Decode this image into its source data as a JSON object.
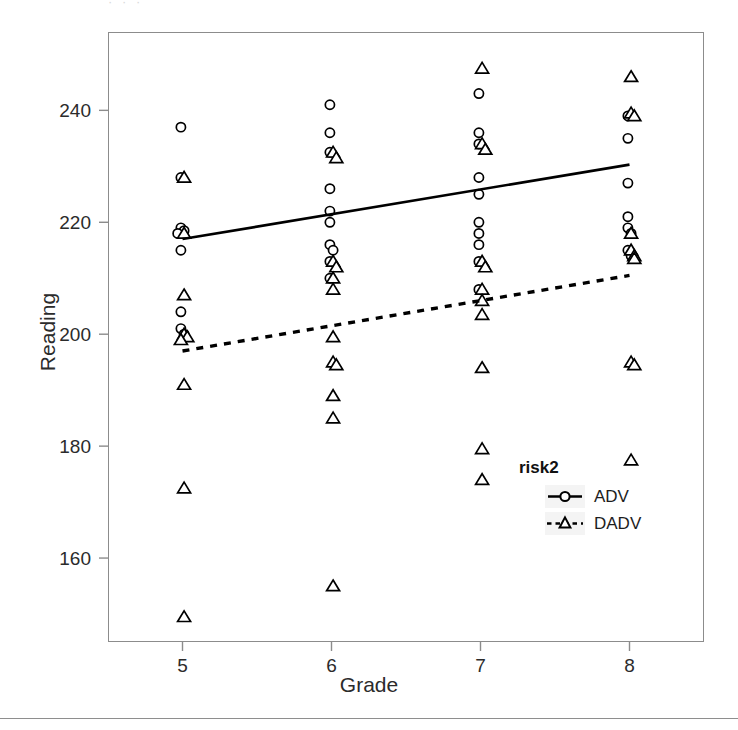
{
  "figure": {
    "scan_artifact_text": "· · ·"
  },
  "axes": {
    "x": {
      "label": "Grade",
      "ticks": [
        "5",
        "6",
        "7",
        "8"
      ],
      "tick_values": [
        5,
        6,
        7,
        8
      ],
      "range": [
        4.5,
        8.5
      ]
    },
    "y": {
      "label": "Reading",
      "ticks": [
        "160",
        "180",
        "200",
        "220",
        "240"
      ],
      "tick_values": [
        160,
        180,
        200,
        220,
        240
      ],
      "range": [
        145,
        254
      ]
    }
  },
  "legend": {
    "title": "risk2",
    "items": [
      {
        "label": "ADV",
        "marker": "circle",
        "line": "solid",
        "color": "#000000"
      },
      {
        "label": "DADV",
        "marker": "triangle",
        "line": "dashed",
        "color": "#000000"
      }
    ]
  },
  "chart_data": {
    "type": "scatter",
    "title": "",
    "xlabel": "Grade",
    "ylabel": "Reading",
    "xlim": [
      4.5,
      8.5
    ],
    "ylim": [
      145,
      254
    ],
    "xticks": [
      5,
      6,
      7,
      8
    ],
    "yticks": [
      160,
      180,
      200,
      220,
      240
    ],
    "grid": false,
    "legend_title": "risk2",
    "legend_position": "inside-lower-right",
    "series": [
      {
        "name": "ADV",
        "marker": "circle",
        "line_style": "solid",
        "color": "#000000",
        "points": [
          {
            "x": 5,
            "y": 237
          },
          {
            "x": 5,
            "y": 228
          },
          {
            "x": 5,
            "y": 219
          },
          {
            "x": 5,
            "y": 218.5
          },
          {
            "x": 5,
            "y": 218
          },
          {
            "x": 5,
            "y": 215
          },
          {
            "x": 5,
            "y": 204
          },
          {
            "x": 5,
            "y": 201
          },
          {
            "x": 5,
            "y": 200
          },
          {
            "x": 5,
            "y": 199.5
          },
          {
            "x": 6,
            "y": 241
          },
          {
            "x": 6,
            "y": 236
          },
          {
            "x": 6,
            "y": 232.5
          },
          {
            "x": 6,
            "y": 226
          },
          {
            "x": 6,
            "y": 222
          },
          {
            "x": 6,
            "y": 220
          },
          {
            "x": 6,
            "y": 216
          },
          {
            "x": 6,
            "y": 215
          },
          {
            "x": 6,
            "y": 213
          },
          {
            "x": 6,
            "y": 210
          },
          {
            "x": 7,
            "y": 243
          },
          {
            "x": 7,
            "y": 236
          },
          {
            "x": 7,
            "y": 234
          },
          {
            "x": 7,
            "y": 228
          },
          {
            "x": 7,
            "y": 225
          },
          {
            "x": 7,
            "y": 220
          },
          {
            "x": 7,
            "y": 218
          },
          {
            "x": 7,
            "y": 216
          },
          {
            "x": 7,
            "y": 213
          },
          {
            "x": 7,
            "y": 208
          },
          {
            "x": 8,
            "y": 239
          },
          {
            "x": 8,
            "y": 235
          },
          {
            "x": 8,
            "y": 227
          },
          {
            "x": 8,
            "y": 221
          },
          {
            "x": 8,
            "y": 219
          },
          {
            "x": 8,
            "y": 218
          },
          {
            "x": 8,
            "y": 215
          },
          {
            "x": 8,
            "y": 214
          }
        ],
        "fit_line": {
          "x0": 5,
          "y0": 217,
          "x1": 8,
          "y1": 230.3
        }
      },
      {
        "name": "DADV",
        "marker": "triangle",
        "line_style": "dashed",
        "color": "#000000",
        "points": [
          {
            "x": 5,
            "y": 228
          },
          {
            "x": 5,
            "y": 218
          },
          {
            "x": 5,
            "y": 207
          },
          {
            "x": 5,
            "y": 200
          },
          {
            "x": 5,
            "y": 199.5
          },
          {
            "x": 5,
            "y": 199
          },
          {
            "x": 5,
            "y": 191
          },
          {
            "x": 5,
            "y": 172.5
          },
          {
            "x": 5,
            "y": 149.5
          },
          {
            "x": 6,
            "y": 232.5
          },
          {
            "x": 6,
            "y": 231.5
          },
          {
            "x": 6,
            "y": 213
          },
          {
            "x": 6,
            "y": 212
          },
          {
            "x": 6,
            "y": 210
          },
          {
            "x": 6,
            "y": 208
          },
          {
            "x": 6,
            "y": 199.5
          },
          {
            "x": 6,
            "y": 195
          },
          {
            "x": 6,
            "y": 194.5
          },
          {
            "x": 6,
            "y": 189
          },
          {
            "x": 6,
            "y": 185
          },
          {
            "x": 6,
            "y": 155
          },
          {
            "x": 7,
            "y": 247.5
          },
          {
            "x": 7,
            "y": 234
          },
          {
            "x": 7,
            "y": 233
          },
          {
            "x": 7,
            "y": 213
          },
          {
            "x": 7,
            "y": 212
          },
          {
            "x": 7,
            "y": 208
          },
          {
            "x": 7,
            "y": 206
          },
          {
            "x": 7,
            "y": 203.5
          },
          {
            "x": 7,
            "y": 194
          },
          {
            "x": 7,
            "y": 179.5
          },
          {
            "x": 7,
            "y": 174
          },
          {
            "x": 8,
            "y": 246
          },
          {
            "x": 8,
            "y": 239.5
          },
          {
            "x": 8,
            "y": 239
          },
          {
            "x": 8,
            "y": 218
          },
          {
            "x": 8,
            "y": 215
          },
          {
            "x": 8,
            "y": 214
          },
          {
            "x": 8,
            "y": 213.5
          },
          {
            "x": 8,
            "y": 195
          },
          {
            "x": 8,
            "y": 194.5
          },
          {
            "x": 8,
            "y": 177.5
          }
        ],
        "fit_line": {
          "x0": 5,
          "y0": 197,
          "x1": 8,
          "y1": 210.5
        }
      }
    ]
  }
}
